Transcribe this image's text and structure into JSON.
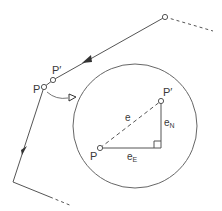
{
  "diagram": {
    "type": "traverse-misclosure",
    "colors": {
      "stroke": "#555555",
      "text": "#3a3a3a",
      "background": "#ffffff"
    },
    "traverse": {
      "label_P": "P",
      "label_P_prime": "P′",
      "direction": "traverse path with filled direction arrows"
    },
    "inset": {
      "description": "enlarged view of misclosure",
      "label_P": "P",
      "label_P_prime": "P′",
      "misclosure_label": "e",
      "easting_label": "e",
      "easting_sub": "E",
      "northing_label": "e",
      "northing_sub": "N"
    }
  }
}
